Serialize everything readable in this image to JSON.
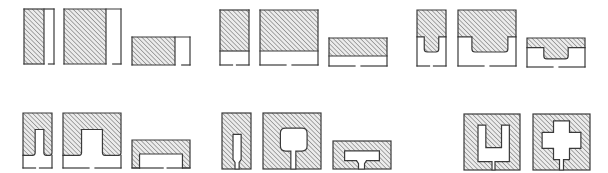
{
  "diagram": {
    "title": "",
    "colors": {
      "background": "#ffffff",
      "stroke": "#3a3a3a",
      "hatch": "#6a6a6a",
      "hatch_bg": "#e9e9e9"
    },
    "rows": [
      {
        "name": "top-row",
        "groups": [
          {
            "name": "full-hatched-blocks",
            "shapes": [
              {
                "name": "tall-narrow",
                "variant": "side-open",
                "x": 24,
                "y": 9,
                "w": 30,
                "h": 55,
                "hatch_w": 20
              },
              {
                "name": "tall-wide",
                "variant": "side-open",
                "x": 64,
                "y": 9,
                "w": 57,
                "h": 55,
                "hatch_w": 42
              },
              {
                "name": "low-wide",
                "variant": "side-open",
                "x": 132,
                "y": 37,
                "w": 58,
                "h": 28,
                "hatch_w": 43
              }
            ]
          },
          {
            "name": "top-hatched-blocks",
            "shapes": [
              {
                "name": "tall-narrow",
                "variant": "top-band",
                "x": 220,
                "y": 10,
                "w": 29,
                "h": 55,
                "band_h": 41
              },
              {
                "name": "tall-wide",
                "variant": "top-band",
                "x": 260,
                "y": 10,
                "w": 58,
                "h": 55,
                "band_h": 41
              },
              {
                "name": "low-wide",
                "variant": "top-band",
                "x": 329,
                "y": 38,
                "w": 58,
                "h": 28,
                "band_h": 18
              }
            ]
          },
          {
            "name": "tongue-blocks",
            "shapes": [
              {
                "name": "tall-narrow",
                "variant": "tongue",
                "x": 417,
                "y": 10,
                "w": 29,
                "h": 56
              },
              {
                "name": "tall-wide",
                "variant": "tongue",
                "x": 458,
                "y": 10,
                "w": 58,
                "h": 56
              },
              {
                "name": "low-wide",
                "variant": "tongue",
                "x": 527,
                "y": 38,
                "w": 58,
                "h": 29
              }
            ]
          }
        ]
      },
      {
        "name": "bottom-row",
        "groups": [
          {
            "name": "arch-blocks",
            "shapes": [
              {
                "name": "tall-narrow",
                "variant": "arch",
                "x": 23,
                "y": 113,
                "w": 29,
                "h": 55
              },
              {
                "name": "tall-wide",
                "variant": "arch",
                "x": 63,
                "y": 113,
                "w": 58,
                "h": 55
              },
              {
                "name": "low-wide",
                "variant": "arch",
                "x": 132,
                "y": 140,
                "w": 58,
                "h": 28
              }
            ]
          },
          {
            "name": "keyhole-blocks",
            "shapes": [
              {
                "name": "tall-narrow",
                "variant": "keyhole",
                "x": 222,
                "y": 113,
                "w": 29,
                "h": 56
              },
              {
                "name": "tall-wide",
                "variant": "keyhole",
                "x": 263,
                "y": 113,
                "w": 58,
                "h": 56
              },
              {
                "name": "low-wide",
                "variant": "keyhole",
                "x": 333,
                "y": 141,
                "w": 58,
                "h": 28
              }
            ]
          },
          {
            "name": "enclosed-void-blocks",
            "shapes": [
              {
                "name": "u-void",
                "variant": "u-void",
                "x": 464,
                "y": 114,
                "w": 56,
                "h": 56
              },
              {
                "name": "cross-void",
                "variant": "cross-void",
                "x": 533,
                "y": 114,
                "w": 57,
                "h": 56
              }
            ]
          }
        ]
      }
    ]
  }
}
